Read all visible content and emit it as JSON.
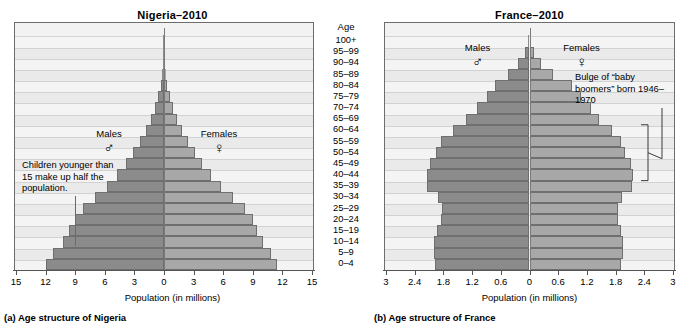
{
  "figure": {
    "age_header": "Age",
    "age_groups": [
      "100+",
      "95–99",
      "90–94",
      "85–89",
      "80–84",
      "75–79",
      "70–74",
      "65–69",
      "60–64",
      "55–59",
      "50–54",
      "45–49",
      "40–44",
      "35–39",
      "30–34",
      "25–29",
      "20–24",
      "15–19",
      "10–14",
      "5–9",
      "0–4"
    ],
    "male_symbol": "♂",
    "female_symbol": "♀",
    "male_label": "Males",
    "female_label": "Females"
  },
  "panel_a": {
    "title": "Nigeria–2010",
    "caption": "(a) Age structure of Nigeria",
    "xlabel": "Population (in millions)",
    "annotation": "Children younger than 15 make up half the population."
  },
  "panel_b": {
    "title": "France–2010",
    "caption": "(b) Age structure of France",
    "xlabel": "Population (in millions)",
    "annotation": "Bulge of “baby boomers” born 1946–1970"
  },
  "chart_data": [
    {
      "type": "bar",
      "orientation": "population-pyramid",
      "title": "Nigeria–2010",
      "xlabel": "Population (in millions)",
      "ylabel": "Age",
      "xlim": [
        -15,
        15
      ],
      "xticks": [
        15,
        12,
        9,
        6,
        3,
        0,
        3,
        6,
        9,
        12,
        15
      ],
      "xtick_values": [
        -15,
        -12,
        -9,
        -6,
        -3,
        0,
        3,
        6,
        9,
        12,
        15
      ],
      "grid": true,
      "legend_position": "inside-top",
      "categories": [
        "100+",
        "95–99",
        "90–94",
        "85–89",
        "80–84",
        "75–79",
        "70–74",
        "65–69",
        "60–64",
        "55–59",
        "50–54",
        "45–49",
        "40–44",
        "35–39",
        "30–34",
        "25–29",
        "20–24",
        "15–19",
        "10–14",
        "5–9",
        "0–4"
      ],
      "series": [
        {
          "name": "Males",
          "values": [
            0.02,
            0.05,
            0.1,
            0.2,
            0.35,
            0.6,
            0.9,
            1.3,
            1.8,
            2.4,
            3.1,
            3.9,
            4.8,
            5.8,
            7.0,
            8.2,
            9.0,
            9.6,
            10.2,
            11.2,
            12.0
          ]
        },
        {
          "name": "Females",
          "values": [
            0.02,
            0.05,
            0.1,
            0.2,
            0.35,
            0.6,
            0.9,
            1.3,
            1.8,
            2.4,
            3.1,
            3.9,
            4.8,
            5.8,
            7.0,
            8.2,
            9.0,
            9.4,
            10.0,
            10.8,
            11.5
          ]
        }
      ],
      "annotations": [
        {
          "text": "Children younger than 15 make up half the population.",
          "points_to": "15–19 and younger",
          "x": -9
        }
      ]
    },
    {
      "type": "bar",
      "orientation": "population-pyramid",
      "title": "France–2010",
      "xlabel": "Population (in millions)",
      "ylabel": "Age",
      "xlim": [
        -3,
        3
      ],
      "xticks": [
        "3",
        "2.4",
        "1.8",
        "1.2",
        "0.6",
        "0",
        "0.6",
        "1.2",
        "1.8",
        "2.4",
        "3"
      ],
      "xtick_values": [
        -3,
        -2.4,
        -1.8,
        -1.2,
        -0.6,
        0,
        0.6,
        1.2,
        1.8,
        2.4,
        3
      ],
      "grid": true,
      "legend_position": "inside-top",
      "categories": [
        "100+",
        "95–99",
        "90–94",
        "85–89",
        "80–84",
        "75–79",
        "70–74",
        "65–69",
        "60–64",
        "55–59",
        "50–54",
        "45–49",
        "40–44",
        "35–39",
        "30–34",
        "25–29",
        "20–24",
        "15–19",
        "10–14",
        "5–9",
        "0–4"
      ],
      "series": [
        {
          "name": "Males",
          "values": [
            0.02,
            0.09,
            0.24,
            0.44,
            0.72,
            0.88,
            1.1,
            1.32,
            1.6,
            1.84,
            1.95,
            2.08,
            2.14,
            2.14,
            1.92,
            1.82,
            1.84,
            1.94,
            2.0,
            2.0,
            1.98
          ]
        },
        {
          "name": "Females",
          "values": [
            0.02,
            0.09,
            0.24,
            0.5,
            0.88,
            1.08,
            1.28,
            1.46,
            1.72,
            1.92,
            2.0,
            2.12,
            2.16,
            2.14,
            1.94,
            1.84,
            1.86,
            1.92,
            1.96,
            1.96,
            1.92
          ]
        }
      ],
      "annotations": [
        {
          "text": "Bulge of “baby boomers” born 1946–1970",
          "points_to": "40–44 to 60–64",
          "bracket": true
        }
      ]
    }
  ]
}
